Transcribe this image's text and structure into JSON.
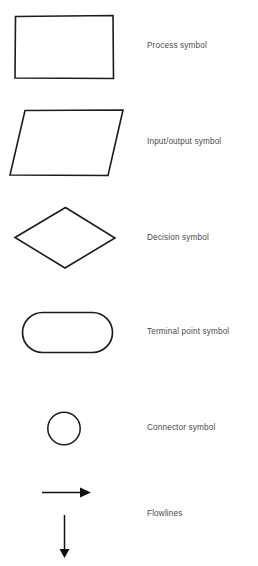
{
  "figure": {
    "background_color": "#ffffff",
    "ink_color": "#1c1c1c",
    "label_color": "#4a4a4a",
    "width": 258,
    "height": 566
  },
  "rows": [
    {
      "shape": "rectangle",
      "shape_icon": "process-rectangle-icon",
      "label": "Process symbol"
    },
    {
      "shape": "parallelogram",
      "shape_icon": "input-output-parallelogram-icon",
      "label": "Input/output symbol"
    },
    {
      "shape": "diamond",
      "shape_icon": "decision-diamond-icon",
      "label": "Decision symbol"
    },
    {
      "shape": "stadium",
      "shape_icon": "terminal-stadium-icon",
      "label": "Terminal point symbol"
    },
    {
      "shape": "circle",
      "shape_icon": "connector-circle-icon",
      "label": "Connector symbol"
    },
    {
      "shape": "arrows",
      "shape_icon": "flowline-arrow-icon",
      "label": "Flowlines"
    }
  ]
}
